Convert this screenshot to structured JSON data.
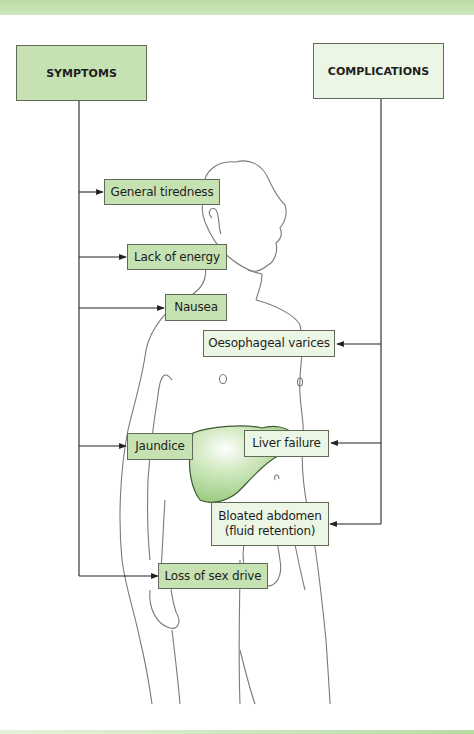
{
  "headers": {
    "symptoms": "SYMPTOMS",
    "complications": "COMPLICATIONS"
  },
  "symptoms": [
    {
      "label": "General tiredness"
    },
    {
      "label": "Lack of energy"
    },
    {
      "label": "Nausea"
    },
    {
      "label": "Jaundice"
    },
    {
      "label": "Loss of sex drive"
    }
  ],
  "complications": [
    {
      "label": "Oesophageal varices"
    },
    {
      "label": "Liver failure"
    },
    {
      "label": "Bloated abdomen (fluid retention)"
    }
  ],
  "colors": {
    "symptom_box": "#c6e2b3",
    "complication_box": "#ecf6e4",
    "liver": "#a9d492",
    "outline": "#777777",
    "band": "#b9dba4"
  }
}
